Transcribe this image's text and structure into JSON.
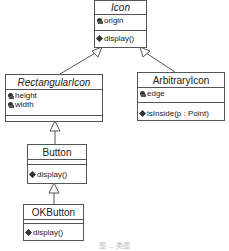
{
  "diagram": {
    "type": "uml-class-diagram",
    "classes": [
      {
        "name": "Icon",
        "abstract": true,
        "attributes": [
          "origin"
        ],
        "operations": [
          "display()"
        ]
      },
      {
        "name": "RectangularIcon",
        "abstract": true,
        "attributes": [
          "height",
          "width"
        ],
        "operations": []
      },
      {
        "name": "ArbitraryIcon",
        "abstract": false,
        "attributes": [
          "edge"
        ],
        "operations": [
          "isInside(p : Point)"
        ]
      },
      {
        "name": "Button",
        "abstract": false,
        "attributes": [],
        "operations": [
          "display()"
        ]
      },
      {
        "name": "OKButton",
        "abstract": false,
        "attributes": [],
        "operations": [
          "display()"
        ]
      }
    ],
    "generalizations": [
      {
        "child": "RectangularIcon",
        "parent": "Icon"
      },
      {
        "child": "ArbitraryIcon",
        "parent": "Icon"
      },
      {
        "child": "Button",
        "parent": "RectangularIcon"
      },
      {
        "child": "OKButton",
        "parent": "Button"
      }
    ],
    "caption": "图 ... 类图",
    "colors": {
      "line": "#555555",
      "text": "#222222",
      "background": "#ffffff"
    }
  }
}
